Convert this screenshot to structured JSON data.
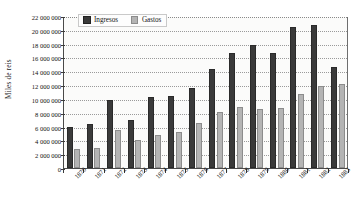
{
  "chart_data": {
    "type": "bar",
    "title": "",
    "subtitle": "",
    "xlabel": "",
    "ylabel": "Miles de reis",
    "ylim": [
      0,
      22000000
    ],
    "ytick_step": 2000000,
    "ytick_labels": [
      "22 000 000",
      "20 000 000",
      "18 000 000",
      "16 000 000",
      "14 000 000",
      "12 000 000",
      "10 000 000",
      "8 000 000",
      "6 000 000",
      "4 000 000",
      "2 000 000",
      "0"
    ],
    "ytick_values": [
      22000000,
      20000000,
      18000000,
      16000000,
      14000000,
      12000000,
      10000000,
      8000000,
      6000000,
      4000000,
      2000000,
      0
    ],
    "grid": true,
    "grid_axis": "y",
    "legend_position": "top-left-inside",
    "categories": [
      "1870",
      "1871",
      "1872",
      "1873",
      "1874",
      "1875",
      "1876",
      "1877",
      "1878",
      "1879",
      "1880",
      "1881",
      "1882",
      "1883"
    ],
    "series": [
      {
        "name": "Ingresos",
        "color": "#3a3a3a",
        "values": [
          5900000,
          6400000,
          9900000,
          6900000,
          10350000,
          10400000,
          11650000,
          14400000,
          16700000,
          17750000,
          16700000,
          20400000,
          20700000,
          14600000
        ]
      },
      {
        "name": "Gastos",
        "color": "#b4b4b4",
        "values": [
          2800000,
          2950000,
          5500000,
          4100000,
          4800000,
          5250000,
          6450000,
          8150000,
          8800000,
          8600000,
          8650000,
          10700000,
          11800000,
          12200000
        ]
      }
    ]
  }
}
